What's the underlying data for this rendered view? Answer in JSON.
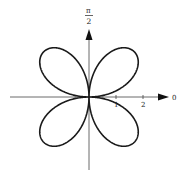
{
  "diagram": {
    "type": "polar-rose",
    "axis_labels": {
      "vertical_top_numerator": "π",
      "vertical_top_denominator": "2",
      "horizontal_right": "0"
    },
    "tick_labels": [
      "1",
      "2"
    ],
    "petals": 4,
    "colors": {
      "stroke": "#1a1a1a",
      "axis": "#333333",
      "background": "#ffffff"
    }
  }
}
